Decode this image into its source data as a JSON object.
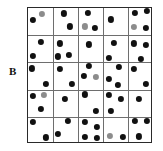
{
  "figure": {
    "panel_label": "B",
    "type": "quadrat-point-pattern",
    "grid": {
      "rows": 5,
      "cols": 5,
      "x": 27,
      "y": 7,
      "width": 125,
      "height": 136
    },
    "colors": {
      "border": "#2a2a2a",
      "gridline": "#6e6e6e",
      "dot_dark": "#111111",
      "dot_gray": "#8c8c8c",
      "background": "#ffffff"
    },
    "dot_radius": 3.1
  },
  "chart_data": {
    "type": "scatter",
    "title": "B",
    "xlabel": "",
    "ylabel": "",
    "xlim": [
      0,
      5
    ],
    "ylim": [
      0,
      5
    ],
    "grid": true,
    "legend": "none",
    "quadrat_counts": [
      [
        2,
        2,
        3,
        1,
        4
      ],
      [
        2,
        3,
        1,
        2,
        3
      ],
      [
        2,
        2,
        3,
        3,
        2
      ],
      [
        3,
        1,
        2,
        3,
        1
      ],
      [
        2,
        2,
        4,
        2,
        3
      ]
    ],
    "total_points": 56,
    "points": [
      {
        "x": 0.2,
        "y": 4.55,
        "shade": "dark"
      },
      {
        "x": 0.56,
        "y": 4.78,
        "shade": "gray"
      },
      {
        "x": 1.42,
        "y": 4.8,
        "shade": "dark"
      },
      {
        "x": 1.66,
        "y": 4.32,
        "shade": "dark"
      },
      {
        "x": 2.38,
        "y": 4.82,
        "shade": "dark"
      },
      {
        "x": 2.26,
        "y": 4.32,
        "shade": "gray"
      },
      {
        "x": 2.66,
        "y": 4.28,
        "shade": "dark"
      },
      {
        "x": 3.32,
        "y": 4.58,
        "shade": "dark"
      },
      {
        "x": 4.26,
        "y": 4.82,
        "shade": "dark"
      },
      {
        "x": 4.76,
        "y": 4.88,
        "shade": "dark"
      },
      {
        "x": 4.24,
        "y": 4.3,
        "shade": "gray"
      },
      {
        "x": 4.7,
        "y": 4.26,
        "shade": "dark"
      },
      {
        "x": 0.5,
        "y": 3.76,
        "shade": "dark"
      },
      {
        "x": 0.18,
        "y": 3.24,
        "shade": "dark"
      },
      {
        "x": 1.26,
        "y": 3.7,
        "shade": "dark"
      },
      {
        "x": 1.18,
        "y": 3.22,
        "shade": "dark"
      },
      {
        "x": 1.62,
        "y": 3.28,
        "shade": "dark"
      },
      {
        "x": 2.44,
        "y": 3.66,
        "shade": "dark"
      },
      {
        "x": 3.44,
        "y": 3.72,
        "shade": "dark"
      },
      {
        "x": 3.24,
        "y": 3.16,
        "shade": "dark"
      },
      {
        "x": 4.22,
        "y": 3.7,
        "shade": "dark"
      },
      {
        "x": 4.72,
        "y": 3.64,
        "shade": "dark"
      },
      {
        "x": 4.5,
        "y": 3.14,
        "shade": "dark"
      },
      {
        "x": 0.16,
        "y": 2.78,
        "shade": "dark"
      },
      {
        "x": 0.72,
        "y": 2.22,
        "shade": "dark"
      },
      {
        "x": 1.26,
        "y": 2.76,
        "shade": "dark"
      },
      {
        "x": 1.74,
        "y": 2.22,
        "shade": "dark"
      },
      {
        "x": 2.44,
        "y": 2.86,
        "shade": "dark"
      },
      {
        "x": 2.22,
        "y": 2.5,
        "shade": "dark"
      },
      {
        "x": 2.72,
        "y": 2.48,
        "shade": "gray"
      },
      {
        "x": 3.62,
        "y": 2.82,
        "shade": "dark"
      },
      {
        "x": 3.22,
        "y": 2.4,
        "shade": "dark"
      },
      {
        "x": 3.6,
        "y": 2.16,
        "shade": "dark"
      },
      {
        "x": 4.24,
        "y": 2.76,
        "shade": "dark"
      },
      {
        "x": 4.72,
        "y": 2.2,
        "shade": "dark"
      },
      {
        "x": 0.18,
        "y": 1.78,
        "shade": "dark"
      },
      {
        "x": 0.62,
        "y": 1.8,
        "shade": "gray"
      },
      {
        "x": 0.52,
        "y": 1.28,
        "shade": "dark"
      },
      {
        "x": 1.46,
        "y": 1.66,
        "shade": "dark"
      },
      {
        "x": 2.26,
        "y": 1.82,
        "shade": "dark"
      },
      {
        "x": 2.72,
        "y": 1.22,
        "shade": "dark"
      },
      {
        "x": 3.24,
        "y": 1.8,
        "shade": "dark"
      },
      {
        "x": 3.7,
        "y": 1.66,
        "shade": "dark"
      },
      {
        "x": 3.32,
        "y": 1.22,
        "shade": "dark"
      },
      {
        "x": 4.42,
        "y": 1.66,
        "shade": "dark"
      },
      {
        "x": 0.18,
        "y": 0.82,
        "shade": "dark"
      },
      {
        "x": 0.7,
        "y": 0.24,
        "shade": "dark"
      },
      {
        "x": 1.6,
        "y": 0.84,
        "shade": "dark"
      },
      {
        "x": 1.18,
        "y": 0.36,
        "shade": "dark"
      },
      {
        "x": 2.28,
        "y": 0.82,
        "shade": "dark"
      },
      {
        "x": 2.76,
        "y": 0.62,
        "shade": "dark"
      },
      {
        "x": 2.26,
        "y": 0.26,
        "shade": "dark"
      },
      {
        "x": 2.74,
        "y": 0.22,
        "shade": "dark"
      },
      {
        "x": 3.26,
        "y": 0.3,
        "shade": "gray"
      },
      {
        "x": 3.78,
        "y": 0.26,
        "shade": "dark"
      },
      {
        "x": 4.28,
        "y": 0.84,
        "shade": "dark"
      },
      {
        "x": 4.76,
        "y": 0.84,
        "shade": "dark"
      },
      {
        "x": 4.44,
        "y": 0.28,
        "shade": "dark"
      }
    ]
  }
}
